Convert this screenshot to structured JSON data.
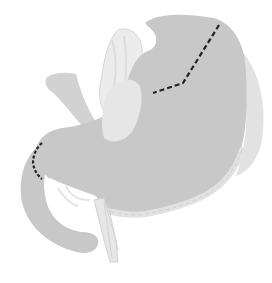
{
  "figure": {
    "colors": {
      "background": "#ffffff",
      "stomach_fill": "#c8c8c8",
      "stomach_shade": "#bdbdbd",
      "surrounding_tissue": "#e4e4e4",
      "vessel_light": "#ececec",
      "vessel_outline": "#d6d6d6",
      "spleen_fill": "#e0e0e0",
      "dashed_line": "#222222"
    },
    "annotations": [
      {
        "name": "proximal-resection-line",
        "style": "dashed",
        "points": [
          [
            219,
            25
          ],
          [
            183,
            83
          ],
          [
            153,
            93
          ]
        ]
      },
      {
        "name": "distal-resection-line",
        "style": "dashed",
        "points": [
          [
            42,
            143
          ],
          [
            35,
            151
          ],
          [
            33,
            162
          ],
          [
            36,
            172
          ],
          [
            42,
            178
          ]
        ]
      }
    ]
  }
}
